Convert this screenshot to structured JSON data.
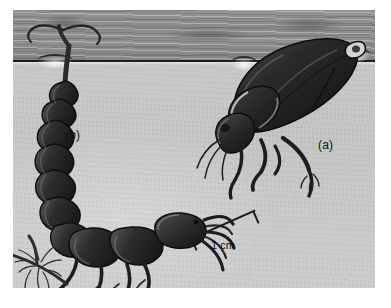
{
  "page": {
    "background_color": "#ffffff",
    "width": 391,
    "height": 308
  },
  "figure": {
    "name": "diving-beetle-and-larva-at-water-surface",
    "media_type": "halftone-photograph-illustration",
    "plate": {
      "left": 13,
      "top": 10,
      "width": 362,
      "height": 278,
      "water_color": "#c7c7c7",
      "air_band_color": "#8b8b8b",
      "surface_line_color": "#1b1b1b",
      "surface_line_y": 50
    },
    "labels": [
      {
        "id": "a",
        "text": "(a)",
        "subject": "adult diving beetle",
        "x": 305,
        "y": 128
      },
      {
        "id": "b",
        "text": "(b)",
        "subject": "diving beetle larva",
        "x": 52,
        "y": 118
      }
    ],
    "scale_bar": {
      "text": "1 cm",
      "length_px": 68,
      "angle_deg": -24,
      "color": "#1d1d1d"
    },
    "subjects": [
      {
        "key": "adult",
        "label": "(a)",
        "description": "adult diving beetle hanging head-down beneath the surface film, abdomen tip piercing the surface",
        "body_color": "#2d2d2d"
      },
      {
        "key": "larva",
        "label": "(b)",
        "description": "segmented diving beetle larva with curved abdomen, caudal siphon at the surface film, large sickle mandibles",
        "body_color": "#3a3a3a"
      }
    ]
  },
  "caption": {
    "visible_fragment": "",
    "note": "caption text clipped below the bottom edge of the screenshot"
  },
  "colors": {
    "water": "#c7c7c7",
    "air_band": "#8b8b8b",
    "surface_line": "#1b1b1b",
    "insect_dark": "#262626",
    "label_text": "#111111",
    "page": "#ffffff"
  }
}
